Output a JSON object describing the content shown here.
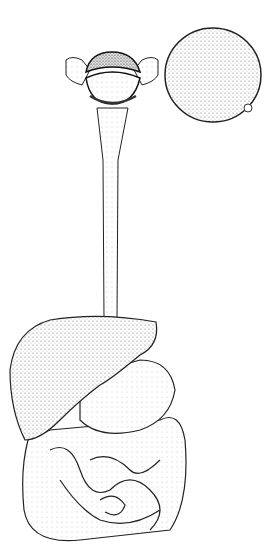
{
  "image": {
    "subject": "digestive system illustration",
    "style": "black ink stipple drawing on white",
    "background": "#ffffff",
    "ink": "#1a1a1a",
    "parts": [
      "mouth",
      "apple",
      "esophagus",
      "liver",
      "stomach",
      "large-intestine",
      "small-intestine"
    ]
  }
}
